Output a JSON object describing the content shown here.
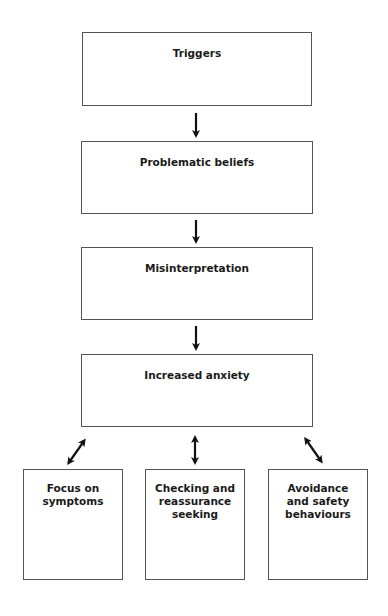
{
  "diagram": {
    "nodes": [
      {
        "id": "triggers",
        "label": "Triggers"
      },
      {
        "id": "problematic-beliefs",
        "label": "Problematic beliefs"
      },
      {
        "id": "misinterpretation",
        "label": "Misinterpretation"
      },
      {
        "id": "increased-anxiety",
        "label": "Increased anxiety"
      },
      {
        "id": "focus-on-symptoms",
        "label": "Focus on symptoms"
      },
      {
        "id": "checking-reassurance",
        "label": "Checking and reassurance seeking"
      },
      {
        "id": "avoidance-safety",
        "label": "Avoidance and safety behaviours"
      }
    ],
    "edges": [
      {
        "from": "triggers",
        "to": "problematic-beliefs",
        "type": "one-way"
      },
      {
        "from": "problematic-beliefs",
        "to": "misinterpretation",
        "type": "one-way"
      },
      {
        "from": "misinterpretation",
        "to": "increased-anxiety",
        "type": "one-way"
      },
      {
        "from": "increased-anxiety",
        "to": "focus-on-symptoms",
        "type": "two-way"
      },
      {
        "from": "increased-anxiety",
        "to": "checking-reassurance",
        "type": "two-way"
      },
      {
        "from": "increased-anxiety",
        "to": "avoidance-safety",
        "type": "two-way"
      }
    ]
  }
}
